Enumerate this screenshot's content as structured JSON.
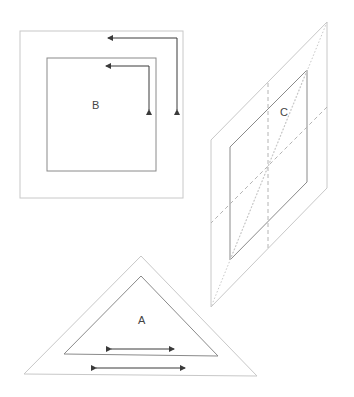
{
  "colors": {
    "background": "#ffffff",
    "outer_stroke": "#c8c8c8",
    "inner_stroke": "#8a8a8a",
    "arrow": "#3a3a3a",
    "label": "#444444"
  },
  "shapes": {
    "square_b": {
      "label": "B",
      "outer": [
        20,
        31,
        183,
        198
      ],
      "inner": [
        47,
        58,
        156,
        171
      ],
      "arrows": [
        {
          "type": "corner",
          "from": [
            177,
            110
          ],
          "corner": [
            177,
            38
          ],
          "to": [
            108,
            38
          ]
        },
        {
          "type": "corner",
          "from": [
            149,
            110
          ],
          "corner": [
            149,
            66
          ],
          "to": [
            106,
            66
          ]
        }
      ]
    },
    "parallelogram_c": {
      "label": "C",
      "outer": [
        [
          211,
          140
        ],
        [
          327,
          22
        ],
        [
          327,
          188
        ],
        [
          211,
          307
        ]
      ],
      "inner": [
        [
          230,
          147
        ],
        [
          307,
          70
        ],
        [
          307,
          182
        ],
        [
          230,
          260
        ]
      ],
      "center": [
        268,
        166
      ]
    },
    "triangle_a": {
      "label": "A",
      "outer": [
        [
          141,
          256
        ],
        [
          257,
          376
        ],
        [
          24,
          374
        ]
      ],
      "inner": [
        [
          141,
          276
        ],
        [
          218,
          356
        ],
        [
          64,
          354
        ]
      ],
      "arrows": [
        {
          "type": "double",
          "from": [
            111,
            349
          ],
          "to": [
            174,
            349
          ]
        },
        {
          "type": "double",
          "from": [
            96,
            368
          ],
          "to": [
            185,
            368
          ]
        }
      ]
    }
  }
}
